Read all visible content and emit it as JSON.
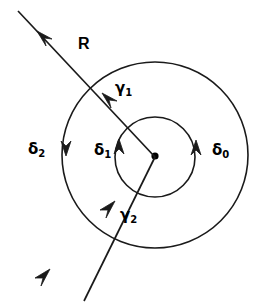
{
  "figure": {
    "kind": "contour-diagram",
    "width": 272,
    "height": 308,
    "background_color": "#ffffff",
    "stroke_color": "#1a1a1a"
  },
  "labels": {
    "ray_label": {
      "text": "R",
      "sub": "",
      "x": 78,
      "y": 44
    },
    "gamma_1": {
      "text": "γ",
      "sub": "1",
      "x": 115,
      "y": 81
    },
    "gamma_2": {
      "text": "γ",
      "sub": "2",
      "x": 120,
      "y": 208
    },
    "delta_0": {
      "text": "δ",
      "sub": "0",
      "x": 212,
      "y": 143
    },
    "delta_1": {
      "text": "δ",
      "sub": "1",
      "x": 94,
      "y": 143
    },
    "delta_2": {
      "text": "δ",
      "sub": "2",
      "x": 28,
      "y": 142
    }
  },
  "geometry": {
    "center": {
      "x": 155,
      "y": 155
    },
    "outer_circle_radius": 93,
    "inner_circle_radius": 40,
    "center_dot_radius": 3.5,
    "line_start": {
      "x": 18,
      "y": 11
    },
    "line_end": {
      "x": 84,
      "y": 300
    }
  },
  "arrows": {
    "upper_ray_head": {
      "x": 38,
      "y": 32,
      "direction": "up-left"
    },
    "lower_ray_head": {
      "x": 49,
      "y": 270,
      "direction": "up-right"
    },
    "gamma_1_head": {
      "x": 104,
      "y": 94,
      "direction": "up-left"
    },
    "gamma_2_head": {
      "x": 113,
      "y": 203,
      "direction": "up-right"
    },
    "delta_0_head": {
      "x": 197,
      "y": 146,
      "direction": "up"
    },
    "delta_1_head": {
      "x": 120,
      "y": 145,
      "direction": "up"
    },
    "delta_2_head": {
      "x": 66,
      "y": 150,
      "direction": "down"
    }
  }
}
